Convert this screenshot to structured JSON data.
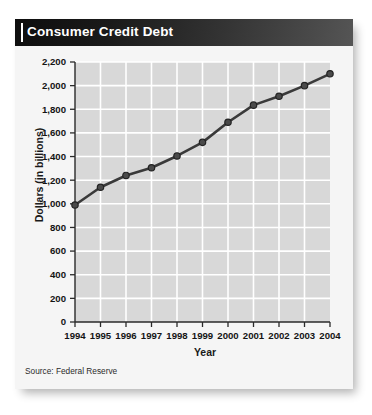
{
  "card": {
    "title": "Consumer Credit Debt",
    "source_note": "Source: Federal Reserve"
  },
  "chart_data": {
    "type": "line",
    "title": "Consumer Credit Debt",
    "xlabel": "Year",
    "ylabel": "Dollars (in billions)",
    "categories": [
      "1994",
      "1995",
      "1996",
      "1997",
      "1998",
      "1999",
      "2000",
      "2001",
      "2002",
      "2003",
      "2004"
    ],
    "values": [
      990,
      1140,
      1240,
      1305,
      1405,
      1520,
      1690,
      1835,
      1910,
      2000,
      2100
    ],
    "x_tick_labels": [
      "1994",
      "1995",
      "1996",
      "1997",
      "1998",
      "1999",
      "2000",
      "2001",
      "2002",
      "2003",
      "2004"
    ],
    "y_tick_labels": [
      "0",
      "200",
      "400",
      "600",
      "800",
      "1,000",
      "1,200",
      "1,400",
      "1,600",
      "1,800",
      "2,000",
      "2,200"
    ],
    "y_tick_values": [
      0,
      200,
      400,
      600,
      800,
      1000,
      1200,
      1400,
      1600,
      1800,
      2000,
      2200
    ],
    "ylim": [
      0,
      2200
    ],
    "grid": true,
    "legend": "none",
    "series_color": "#3a3a3a",
    "marker": "circle",
    "plot_background": "#d8d8d8",
    "gridline_color": "#ffffff",
    "source": "Source: Federal Reserve"
  },
  "colors": {
    "title_bar_dark": "#0e0e0e",
    "title_bar_light": "#555555",
    "card_background": "#f5f5f5",
    "plot_area": "#d8d8d8",
    "line": "#3a3a3a",
    "text": "#141414"
  }
}
